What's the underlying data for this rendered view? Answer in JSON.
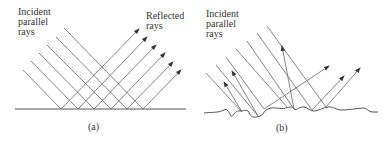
{
  "panel_a": {
    "incident_label": "Incident\nparallel\nrays",
    "reflected_label": "Reflected\nrays",
    "caption": "(a)",
    "surface_type": "smooth (specular reflection)"
  },
  "panel_b": {
    "incident_label": "Incident\nparallel\nrays",
    "caption": "(b)",
    "surface_type": "rough (diffuse reflection)"
  },
  "colors": {
    "line": "#555555",
    "text": "#333333",
    "background": "#ffffff"
  }
}
